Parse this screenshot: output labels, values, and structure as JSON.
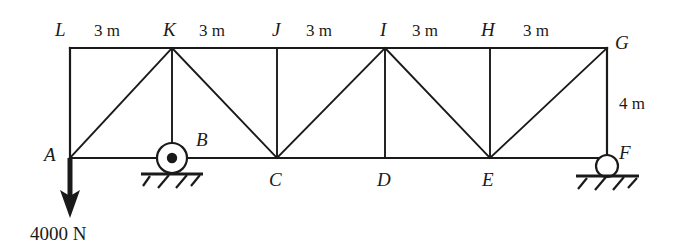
{
  "figure": {
    "type": "truss-free-body-diagram",
    "stroke_color": "#1a1a1a",
    "background_color": "#ffffff"
  },
  "nodes": {
    "top": [
      {
        "id": "L",
        "label": "L",
        "x": 70,
        "y": 48
      },
      {
        "id": "K",
        "label": "K",
        "x": 172,
        "y": 48
      },
      {
        "id": "J",
        "label": "J",
        "x": 277,
        "y": 48
      },
      {
        "id": "I",
        "label": "I",
        "x": 385,
        "y": 48
      },
      {
        "id": "H",
        "label": "H",
        "x": 490,
        "y": 48
      },
      {
        "id": "G",
        "label": "G",
        "x": 607,
        "y": 48
      }
    ],
    "bottom": [
      {
        "id": "A",
        "label": "A",
        "x": 70,
        "y": 158
      },
      {
        "id": "B",
        "label": "B",
        "x": 172,
        "y": 158
      },
      {
        "id": "C",
        "label": "C",
        "x": 277,
        "y": 158
      },
      {
        "id": "D",
        "label": "D",
        "x": 385,
        "y": 158
      },
      {
        "id": "E",
        "label": "E",
        "x": 490,
        "y": 158
      },
      {
        "id": "F",
        "label": "F",
        "x": 607,
        "y": 158
      }
    ]
  },
  "members": {
    "top_chord": "L-K-J-I-H-G",
    "bottom_chord": "A-B-C-D-E-F",
    "verticals": [
      "L-A",
      "K-B",
      "J-C",
      "I-D",
      "H-E",
      "G-F"
    ],
    "diagonals": [
      "A-K",
      "K-C",
      "C-I",
      "I-E",
      "E-G"
    ]
  },
  "dimensions": {
    "top_spans": [
      {
        "label": "3 m",
        "between": "L-K",
        "x": 121,
        "y": 30
      },
      {
        "label": "3 m",
        "between": "K-J",
        "x": 224,
        "y": 30
      },
      {
        "label": "3 m",
        "between": "J-I",
        "x": 331,
        "y": 30
      },
      {
        "label": "3 m",
        "between": "I-H",
        "x": 437,
        "y": 30
      },
      {
        "label": "3 m",
        "between": "H-G",
        "x": 548,
        "y": 30
      }
    ],
    "height": {
      "label": "4 m",
      "between": "G-F",
      "x": 630,
      "y": 103
    }
  },
  "supports": [
    {
      "id": "B",
      "kind": "pin-support",
      "at_node": "B",
      "x": 172,
      "y": 158
    },
    {
      "id": "F",
      "kind": "roller-support",
      "at_node": "F",
      "x": 607,
      "y": 158
    }
  ],
  "loads": [
    {
      "id": "load-A",
      "label": "4000 N",
      "magnitude": 4000,
      "unit": "N",
      "direction": "down",
      "at_node": "A",
      "x": 70,
      "y_start": 158,
      "y_end": 216
    }
  ],
  "labels": {
    "L": "L",
    "K": "K",
    "J": "J",
    "I": "I",
    "H": "H",
    "G": "G",
    "A": "A",
    "B": "B",
    "C": "C",
    "D": "D",
    "E": "E",
    "F": "F",
    "span_1": "3 m",
    "span_2": "3 m",
    "span_3": "3 m",
    "span_4": "3 m",
    "span_5": "3 m",
    "height": "4 m",
    "load": "4000 N"
  }
}
